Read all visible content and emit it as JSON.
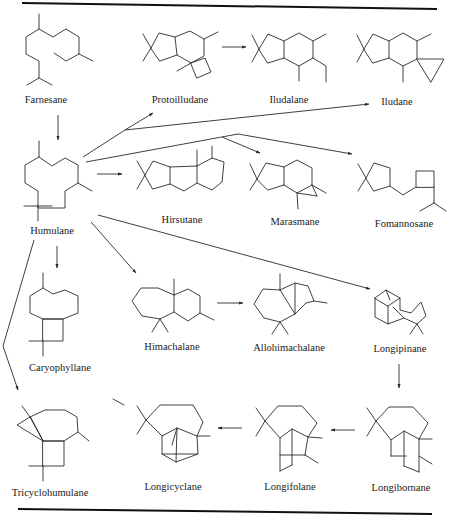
{
  "figure": {
    "compounds": {
      "farnesane": "Farnesane",
      "protoilludane": "Protoilludane",
      "iludalane": "Iludalane",
      "iludane": "Iludane",
      "humulane": "Humulane",
      "hirsutane": "Hirsutane",
      "marasmane": "Marasmane",
      "fomannosane": "Fomannosane",
      "caryophyllane": "Caryophyllane",
      "himachalane": "Himachalane",
      "allohimachalane": "Allohimachalane",
      "longipinane": "Longipinane",
      "tricyclohumulane": "Tricyclohumulane",
      "longicyclane": "Longicyclane",
      "longifolane": "Longifolane",
      "longibornane": "Longibornane"
    },
    "pathways": [
      {
        "from": "Farnesane",
        "to": "Humulane"
      },
      {
        "from": "Humulane",
        "to": "Protoilludane"
      },
      {
        "from": "Protoilludane",
        "to": "Iludalane"
      },
      {
        "from": "Humulane",
        "to": "Iludane"
      },
      {
        "from": "Humulane",
        "to": "Hirsutane"
      },
      {
        "from": "Humulane",
        "to": "Marasmane"
      },
      {
        "from": "Humulane",
        "to": "Fomannosane"
      },
      {
        "from": "Humulane",
        "to": "Caryophyllane"
      },
      {
        "from": "Humulane",
        "to": "Himachalane"
      },
      {
        "from": "Himachalane",
        "to": "Allohimachalane"
      },
      {
        "from": "Humulane",
        "to": "Longipinane"
      },
      {
        "from": "Longipinane",
        "to": "Longibornane"
      },
      {
        "from": "Longibornane",
        "to": "Longifolane"
      },
      {
        "from": "Longifolane",
        "to": "Longicyclane"
      },
      {
        "from": "Humulane",
        "to": "Tricyclohumulane"
      }
    ]
  }
}
